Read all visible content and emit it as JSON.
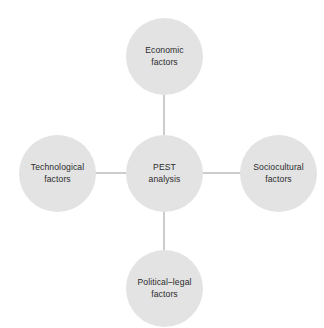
{
  "diagram": {
    "type": "hub-and-spoke",
    "title": "PEST analysis",
    "background_color": "#ffffff",
    "node_fill_color": "#e3e3e3",
    "text_color": "#2b2b2b",
    "connector_color": "#999999",
    "center": {
      "id": "pest-analysis",
      "label": "PEST\nanalysis",
      "line1": "PEST",
      "line2": "analysis",
      "cx": 164,
      "cy": 173,
      "r": 38.5
    },
    "nodes": [
      {
        "id": "economic-factors",
        "label": "Economic\nfactors",
        "line1": "Economic",
        "line2": "factors",
        "position": "top",
        "cx": 164,
        "cy": 56,
        "r": 38.5
      },
      {
        "id": "sociocultural-factors",
        "label": "Sociocultural\nfactors",
        "line1": "Sociocultural",
        "line2": "factors",
        "position": "right",
        "cx": 279,
        "cy": 173,
        "r": 38.5
      },
      {
        "id": "political-legal-factors",
        "label": "Political–legal\nfactors",
        "line1": "Political–legal",
        "line2": "factors",
        "position": "bottom",
        "cx": 164,
        "cy": 289,
        "r": 38.5
      },
      {
        "id": "technological-factors",
        "label": "Technological\nfactors",
        "line1": "Technological",
        "line2": "factors",
        "position": "left",
        "cx": 57,
        "cy": 173,
        "r": 38.5
      }
    ],
    "connectors": [
      {
        "id": "center-to-top",
        "x1": 164,
        "y1": 135,
        "x2": 164,
        "y2": 95
      },
      {
        "id": "center-to-bottom",
        "x1": 164,
        "y1": 211,
        "x2": 164,
        "y2": 251
      },
      {
        "id": "center-to-left",
        "x1": 126,
        "y1": 173,
        "x2": 95,
        "y2": 173
      },
      {
        "id": "center-to-right",
        "x1": 202,
        "y1": 173,
        "x2": 241,
        "y2": 173
      }
    ]
  }
}
